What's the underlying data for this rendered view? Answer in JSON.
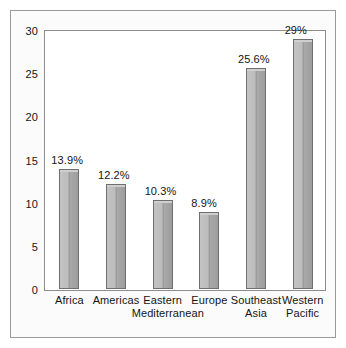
{
  "chart_data": {
    "type": "bar",
    "title": "",
    "subtitle": "",
    "xlabel": "",
    "ylabel": "",
    "categories": [
      "Africa",
      "Americas",
      "Eastern Mediterranean",
      "Europe",
      "Southeast Asia",
      "Western Pacific"
    ],
    "category_lines": [
      [
        "Africa",
        ""
      ],
      [
        "Americas",
        ""
      ],
      [
        "Eastern",
        "Mediterranean"
      ],
      [
        "Europe",
        ""
      ],
      [
        "Southeast",
        "Asia"
      ],
      [
        "Western",
        "Pacific"
      ]
    ],
    "values": [
      13.9,
      12.2,
      10.3,
      8.9,
      25.6,
      29
    ],
    "value_labels": [
      "13.9%",
      "12.2%",
      "10.3%",
      "8.9%",
      "25.6%",
      "29%"
    ],
    "ylim": [
      0,
      30
    ],
    "yticks": [
      0,
      5,
      10,
      15,
      20,
      25,
      30
    ],
    "ytick_labels": [
      "0",
      "5",
      "10",
      "15",
      "20",
      "25",
      "30"
    ],
    "grid": false,
    "legend": null,
    "bar_color": "#b6b6b6",
    "bar_edge_color": "#6f6f6f",
    "plot_background": "#ffffff",
    "figure_background": "#fbfbfb",
    "axis_color": "#8d8d8d",
    "text_color": "#141414"
  }
}
